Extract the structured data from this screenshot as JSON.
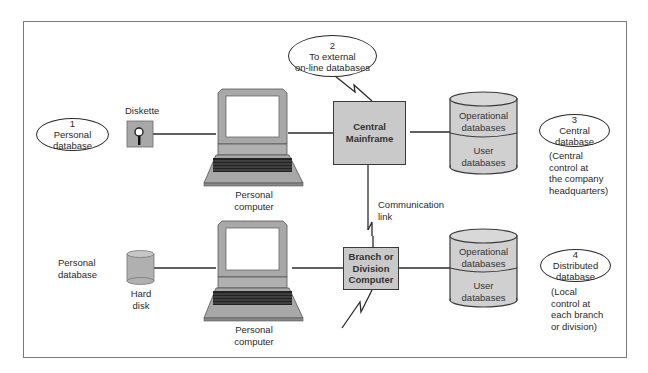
{
  "diagram": {
    "nodes": {
      "personal_db_1": {
        "number": "1",
        "line1": "Personal",
        "line2": "database"
      },
      "external_db_2": {
        "number": "2",
        "line1": "To external",
        "line2": "on-line databases"
      },
      "central_db_3": {
        "number": "3",
        "line1": "Central",
        "line2": "database"
      },
      "distributed_db_4": {
        "number": "4",
        "line1": "Distributed",
        "line2": "database"
      }
    },
    "labels": {
      "diskette": "Diskette",
      "personal_computer_top_1": "Personal",
      "personal_computer_top_2": "computer",
      "personal_computer_bottom_1": "Personal",
      "personal_computer_bottom_2": "computer",
      "personal_database_1": "Personal",
      "personal_database_2": "database",
      "hard_disk_1": "Hard",
      "hard_disk_2": "disk",
      "communication_link_1": "Communication",
      "communication_link_2": "link"
    },
    "central_mainframe": {
      "line1": "Central",
      "line2": "Mainframe"
    },
    "branch_computer": {
      "line1": "Branch or",
      "line2": "Division",
      "line3": "Computer"
    },
    "central_cylinder": {
      "top_line1": "Operational",
      "top_line2": "databases",
      "bottom_line1": "User",
      "bottom_line2": "databases"
    },
    "branch_cylinder": {
      "top_line1": "Operational",
      "top_line2": "databases",
      "bottom_line1": "User",
      "bottom_line2": "databases"
    },
    "notes": {
      "central": [
        "(Central",
        "control at",
        "the company",
        "headquarters)"
      ],
      "local": [
        "(Local",
        "control at",
        "each branch",
        "or division)"
      ]
    },
    "colors": {
      "box_fill": "#c9c9c9",
      "device_fill": "#a8a8a8",
      "line": "#2a2a2a",
      "frame": "#7a7a7a"
    }
  }
}
